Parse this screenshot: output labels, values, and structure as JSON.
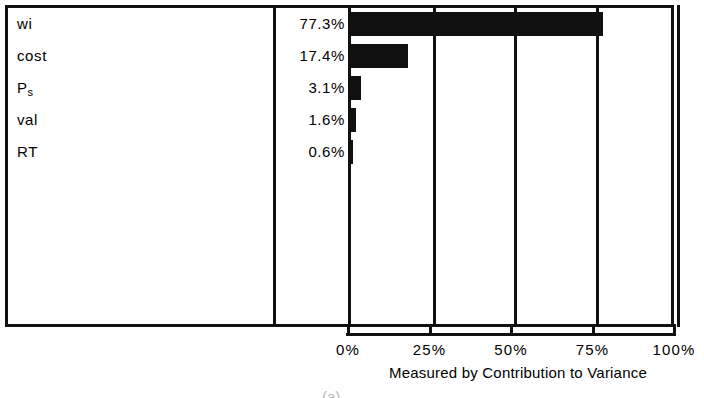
{
  "chart_data": {
    "type": "bar",
    "orientation": "horizontal",
    "title": "",
    "subtitle": "",
    "xlabel": "Measured by Contribution to Variance",
    "ylabel": "",
    "categories": [
      "wi",
      "Ps",
      "cost",
      "val",
      "RT"
    ],
    "grid": true,
    "legend": null,
    "xlim": [
      0,
      100
    ],
    "xticks": [
      0,
      25,
      50,
      75,
      100
    ],
    "xtick_labels": [
      "0%",
      "25%",
      "50%",
      "75%",
      "100%"
    ],
    "bar_color": "#111111",
    "rows": [
      {
        "name": "wi",
        "name_base": "wi",
        "name_sub": "",
        "value": 77.3,
        "value_label": "77.3%"
      },
      {
        "name": "cost",
        "name_base": "cost",
        "name_sub": "",
        "value": 17.4,
        "value_label": "17.4%"
      },
      {
        "name": "Ps",
        "name_base": "P",
        "name_sub": "s",
        "value": 3.1,
        "value_label": "3.1%"
      },
      {
        "name": "val",
        "name_base": "val",
        "name_sub": "",
        "value": 1.6,
        "value_label": "1.6%"
      },
      {
        "name": "RT",
        "name_base": "RT",
        "name_sub": "",
        "value": 0.6,
        "value_label": "0.6%"
      }
    ],
    "values": [
      77.3,
      17.4,
      3.1,
      1.6,
      0.6
    ],
    "value_labels": [
      "77.3%",
      "17.4%",
      "3.1%",
      "1.6%",
      "0.6%"
    ]
  },
  "axis": {
    "caption": "Measured by Contribution to Variance",
    "ticks": [
      {
        "label": "0%",
        "value": 0
      },
      {
        "label": "25%",
        "value": 25
      },
      {
        "label": "50%",
        "value": 50
      },
      {
        "label": "75%",
        "value": 75
      },
      {
        "label": "100%",
        "value": 100
      }
    ]
  },
  "figure": {
    "caption": "(a)"
  }
}
